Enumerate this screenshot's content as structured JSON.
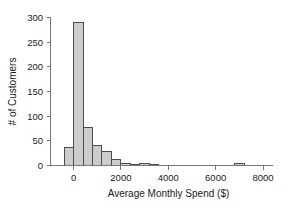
{
  "chart_data": {
    "type": "bar",
    "title": "",
    "subtitle": "",
    "xlabel": "Average Monthly Spend ($)",
    "ylabel": "# of Customers",
    "xlim": [
      -550,
      8400
    ],
    "ylim": [
      0,
      305
    ],
    "xticks": [
      0,
      2000,
      4000,
      6000,
      8000
    ],
    "xtick_labels": [
      "0",
      "2000",
      "4000",
      "6000",
      "8000"
    ],
    "yticks": [
      0,
      50,
      100,
      150,
      200,
      250,
      300
    ],
    "ytick_labels": [
      "0",
      "50",
      "100",
      "150",
      "200",
      "250",
      "300"
    ],
    "grid": false,
    "legend": null,
    "bin_width": 400,
    "bin_edges": [
      -400,
      0,
      400,
      800,
      1200,
      1600,
      2000,
      2400,
      2800,
      3200,
      3600,
      6800,
      7200
    ],
    "bins": [
      {
        "x0": -400,
        "x1": 0,
        "value": 37
      },
      {
        "x0": 0,
        "x1": 400,
        "value": 290
      },
      {
        "x0": 400,
        "x1": 800,
        "value": 77
      },
      {
        "x0": 800,
        "x1": 1200,
        "value": 40
      },
      {
        "x0": 1200,
        "x1": 1600,
        "value": 29
      },
      {
        "x0": 1600,
        "x1": 2000,
        "value": 12
      },
      {
        "x0": 2000,
        "x1": 2400,
        "value": 4
      },
      {
        "x0": 2400,
        "x1": 2800,
        "value": 3
      },
      {
        "x0": 2800,
        "x1": 3200,
        "value": 4
      },
      {
        "x0": 3200,
        "x1": 3600,
        "value": 2
      },
      {
        "x0": 6800,
        "x1": 7200,
        "value": 5
      }
    ],
    "bar_fill_color": "#cccccc",
    "bar_edge_color": "#4d4d4d",
    "axis_color": "#777777",
    "text_color": "#1a1a1a"
  }
}
